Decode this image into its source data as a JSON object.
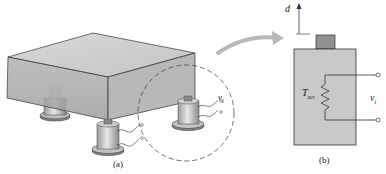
{
  "figure": {
    "panel_a": {
      "caption": "(a)",
      "signal_label": "v",
      "signal_subscript": "i"
    },
    "panel_b": {
      "caption": "(b)",
      "displacement_label": "d",
      "element_label": "T",
      "element_subscript": "act",
      "signal_label": "v",
      "signal_subscript": "i"
    }
  },
  "colors": {
    "box_front": "#a9a9a9",
    "box_top": "#cfcfcf",
    "box_side": "#b6b6b6",
    "sensor_body": "#c8c8c8",
    "sensor_cap": "#8f8f8f",
    "arrow": "#b8b8b8",
    "line": "#333333"
  }
}
